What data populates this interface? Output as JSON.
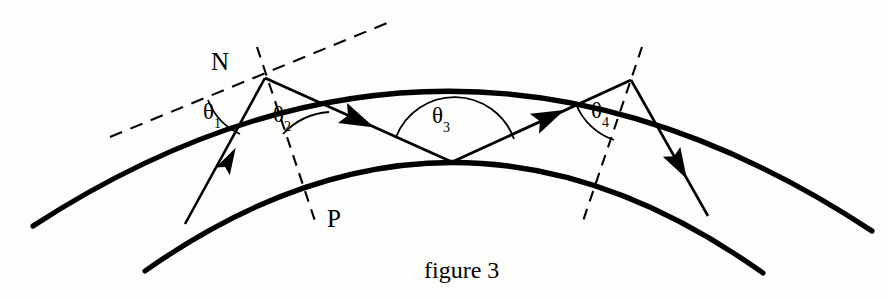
{
  "figure": {
    "caption": "figure 3",
    "background_color": "#fdfdfb",
    "stroke_color": "#000000"
  },
  "labels": {
    "point_n": "N",
    "point_p": "P",
    "theta1": "θ",
    "theta1_sub": "1",
    "theta2": "θ",
    "theta2_sub": "2",
    "theta3": "θ",
    "theta3_sub": "3",
    "theta4": "θ",
    "theta4_sub": "4"
  },
  "diagram_data": {
    "type": "geometry-diagram",
    "arcs": [
      {
        "name": "outer-boundary-arc",
        "description": "upper curved surface",
        "start": [
          33,
          226
        ],
        "end": [
          872,
          231
        ],
        "apex": [
          452,
          41
        ]
      },
      {
        "name": "inner-boundary-arc",
        "description": "lower curved surface",
        "start": [
          145,
          271
        ],
        "end": [
          763,
          273
        ],
        "apex": [
          452,
          162
        ]
      }
    ],
    "vertices": [
      {
        "name": "N",
        "x": 265,
        "y": 78,
        "on": "outer-boundary-arc"
      },
      {
        "name": "reflection-point",
        "x": 452,
        "y": 162,
        "on": "inner-boundary-arc"
      },
      {
        "name": "exit-point",
        "x": 631,
        "y": 80,
        "on": "outer-boundary-arc"
      }
    ],
    "rays": [
      {
        "name": "incident-ray",
        "from": [
          185,
          224
        ],
        "to": [
          265,
          78
        ],
        "arrow_at": 0.55
      },
      {
        "name": "refracted-ray-down",
        "from": [
          265,
          78
        ],
        "to": [
          452,
          162
        ],
        "arrow_at": 0.48
      },
      {
        "name": "reflected-ray-up",
        "from": [
          452,
          162
        ],
        "to": [
          631,
          80
        ],
        "arrow_at": 0.55
      },
      {
        "name": "exit-ray",
        "from": [
          631,
          80
        ],
        "to": [
          707,
          215
        ],
        "arrow_at": 0.62
      }
    ],
    "dashed_lines": [
      {
        "name": "tangent-line-at-N",
        "from": [
          110,
          136
        ],
        "to": [
          390,
          22
        ]
      },
      {
        "name": "normal-line-at-N",
        "from": [
          258,
          48
        ],
        "to": [
          314,
          221
        ]
      },
      {
        "name": "normal-line-at-exit",
        "from": [
          641,
          48
        ],
        "to": [
          583,
          221
        ]
      }
    ],
    "angles": [
      {
        "name": "theta1",
        "vertex": [
          265,
          78
        ],
        "between": [
          "tangent-line-at-N",
          "incident-ray"
        ],
        "label_pos": [
          207,
          100
        ]
      },
      {
        "name": "theta2",
        "vertex": [
          265,
          78
        ],
        "between": [
          "normal-line-at-N",
          "refracted-ray-down"
        ],
        "label_pos": [
          275,
          104
        ]
      },
      {
        "name": "theta3",
        "vertex": [
          452,
          162
        ],
        "between": [
          "refracted-ray-down",
          "reflected-ray-up"
        ],
        "label_pos": [
          433,
          106
        ]
      },
      {
        "name": "theta4",
        "vertex": [
          631,
          80
        ],
        "between": [
          "reflected-ray-up",
          "normal-line-at-exit"
        ],
        "label_pos": [
          594,
          100
        ]
      }
    ]
  }
}
